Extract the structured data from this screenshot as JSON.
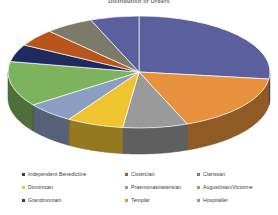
{
  "title": "Distribution of Orders",
  "chart_data": {
    "type": "pie",
    "title": "Distribution of Orders",
    "legend_position": "bottom",
    "grid": false,
    "labels": [
      "Independent Benedictine",
      "Cistercian",
      "Clarissan",
      "Dominican",
      "Praemonastratensian",
      "Augustinian/Victorine",
      "Grandmontain",
      "Templar",
      "Hospitaller",
      "Other"
    ],
    "slices": [
      {
        "label": "Independent Benedictine",
        "value": 27,
        "color": "#5a5f9e"
      },
      {
        "label": "Cistercian",
        "value": 17,
        "color": "#e8913c"
      },
      {
        "label": "Clarissan",
        "value": 8,
        "color": "#9a9a9a"
      },
      {
        "label": "Dominican",
        "value": 7,
        "color": "#f0c330"
      },
      {
        "label": "Praemonastratensian",
        "value": 6,
        "color": "#8b9dc0"
      },
      {
        "label": "Augustinian/Victorine",
        "value": 13,
        "color": "#7cb35c"
      },
      {
        "label": "Grandmontain",
        "value": 5,
        "color": "#1f2a5e"
      },
      {
        "label": "Templar",
        "value": 5,
        "color": "#b8541c"
      },
      {
        "label": "Hospitaller",
        "value": 6,
        "color": "#7c7a68"
      },
      {
        "label": "Other",
        "value": 6,
        "color": "#5a5f9e"
      }
    ]
  },
  "legend": {
    "items": [
      {
        "label": "Independent Benedictine",
        "color": "#2f3d7e"
      },
      {
        "label": "Cistercian",
        "color": "#b8541c"
      },
      {
        "label": "Clarissan",
        "color": "#7c7a68"
      },
      {
        "label": "Dominican",
        "color": "#f0c330"
      },
      {
        "label": "Praemonastratensian",
        "color": "#8b9dc0"
      },
      {
        "label": "Augustinian/Victorine",
        "color": "#7cb35c"
      },
      {
        "label": "Grandmontain",
        "color": "#3a3a42"
      },
      {
        "label": "Templar",
        "color": "#e8913c"
      },
      {
        "label": "Hospitaller",
        "color": "#9a9a9a"
      }
    ]
  }
}
